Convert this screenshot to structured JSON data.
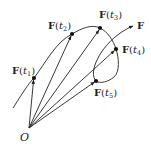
{
  "diagram": {
    "curve_label": "F",
    "origin_label": "O",
    "stroke_color": "#222222",
    "background": "#ffffff",
    "points": [
      {
        "name": "F",
        "arg": "t",
        "sub": "1",
        "x": 34,
        "y": 78,
        "label_x": 12,
        "label_y": 66
      },
      {
        "name": "F",
        "arg": "t",
        "sub": "2",
        "x": 72,
        "y": 34,
        "label_x": 48,
        "label_y": 21
      },
      {
        "name": "F",
        "arg": "t",
        "sub": "3",
        "x": 100,
        "y": 28,
        "label_x": 99,
        "label_y": 10
      },
      {
        "name": "F",
        "arg": "t",
        "sub": "4",
        "x": 116,
        "y": 49,
        "label_x": 122,
        "label_y": 45
      },
      {
        "name": "F",
        "arg": "t",
        "sub": "5",
        "x": 96,
        "y": 81,
        "label_x": 94,
        "label_y": 88
      }
    ],
    "origin": {
      "x": 29,
      "y": 128
    }
  }
}
